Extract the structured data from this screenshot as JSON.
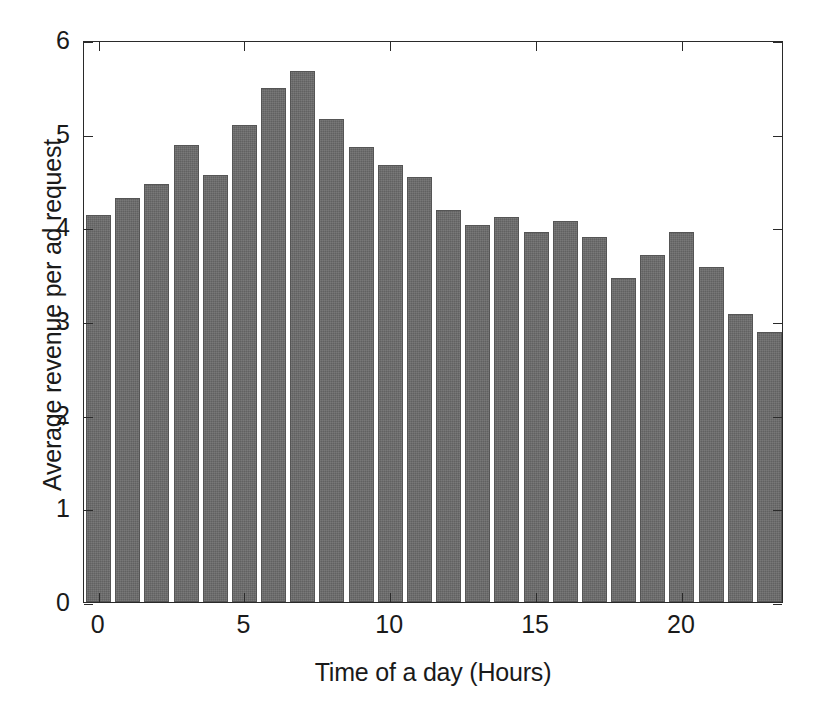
{
  "chart_data": {
    "type": "bar",
    "title": "",
    "xlabel": "Time of a day (Hours)",
    "ylabel": "Average revenue per ad request",
    "categories": [
      0,
      1,
      2,
      3,
      4,
      5,
      6,
      7,
      8,
      9,
      10,
      11,
      12,
      13,
      14,
      15,
      16,
      17,
      18,
      19,
      20,
      21,
      22,
      23
    ],
    "values": [
      4.13,
      4.31,
      4.46,
      4.88,
      4.56,
      5.09,
      5.49,
      5.67,
      5.16,
      4.86,
      4.67,
      4.54,
      4.18,
      4.03,
      4.11,
      3.95,
      4.07,
      3.9,
      3.46,
      3.71,
      3.95,
      3.58,
      3.07,
      2.88
    ],
    "xlim": [
      -0.5,
      23.5
    ],
    "ylim": [
      0,
      6
    ],
    "xticks": [
      0,
      5,
      10,
      15,
      20
    ],
    "yticks": [
      0,
      1,
      2,
      3,
      4,
      5,
      6
    ],
    "xtick_labels": [
      "0",
      "5",
      "10",
      "15",
      "20"
    ],
    "ytick_labels": [
      "0",
      "1",
      "2",
      "3",
      "4",
      "5",
      "6"
    ],
    "grid": false,
    "legend": null,
    "bar_color": "#6b6b6b",
    "bar_edge_color": "#555555",
    "axes_color": "#2a2a2a",
    "background_color": "#ffffff"
  }
}
